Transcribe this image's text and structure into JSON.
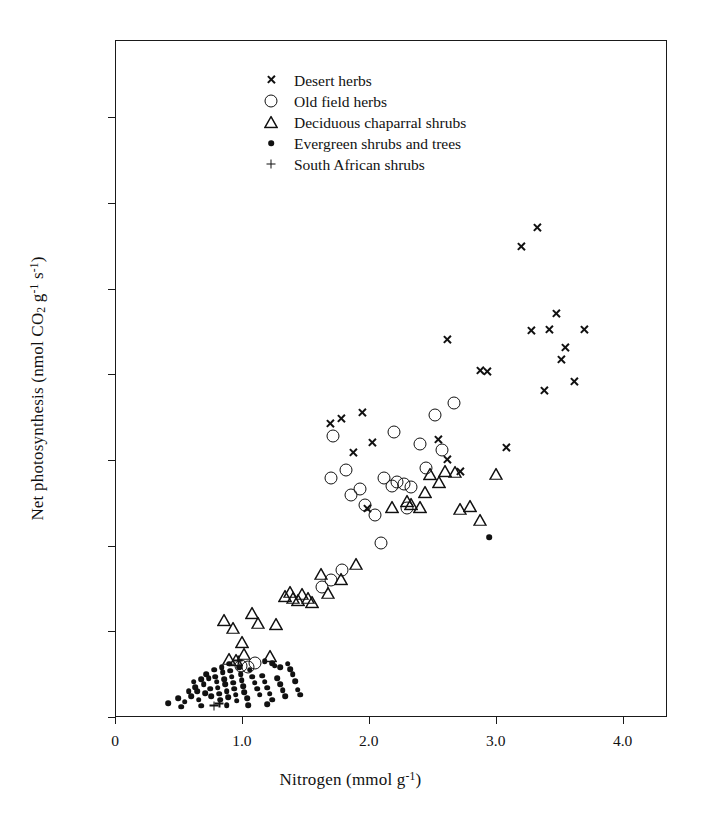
{
  "chart_data": {
    "type": "scatter",
    "title": "",
    "xlabel": "Nitrogen (mmol g-1)",
    "ylabel": "Net photosynthesis (nmol CO2 g-1 s-1)",
    "xlim": [
      0,
      4.35
    ],
    "ylim": [
      0,
      790
    ],
    "xticks": [
      0,
      1.0,
      2.0,
      3.0,
      4.0
    ],
    "xticklabels": [
      "0",
      "1.0",
      "2.0",
      "3.0",
      "4.0"
    ],
    "yticks": [
      0,
      100,
      200,
      300,
      400,
      500,
      600,
      700
    ],
    "yticklabels": [
      "0",
      "100",
      "200",
      "300",
      "400",
      "500",
      "600",
      "700"
    ],
    "grid": false,
    "legend_position": "top-center",
    "series": [
      {
        "name": "Desert herbs",
        "marker": "cross-icon",
        "points": [
          [
            1.7,
            343
          ],
          [
            1.78,
            348
          ],
          [
            1.95,
            355
          ],
          [
            2.03,
            320
          ],
          [
            1.88,
            309
          ],
          [
            1.99,
            243
          ],
          [
            2.55,
            324
          ],
          [
            2.62,
            301
          ],
          [
            2.88,
            404
          ],
          [
            2.93,
            403
          ],
          [
            3.08,
            315
          ],
          [
            3.2,
            549
          ],
          [
            3.33,
            571
          ],
          [
            3.28,
            451
          ],
          [
            3.42,
            452
          ],
          [
            3.38,
            381
          ],
          [
            3.48,
            471
          ],
          [
            3.52,
            417
          ],
          [
            3.55,
            431
          ],
          [
            3.62,
            391
          ],
          [
            3.7,
            452
          ],
          [
            2.72,
            287
          ],
          [
            2.62,
            440
          ]
        ]
      },
      {
        "name": "Old field herbs",
        "marker": "circle-icon",
        "points": [
          [
            1.72,
            328
          ],
          [
            1.7,
            279
          ],
          [
            1.82,
            288
          ],
          [
            1.86,
            259
          ],
          [
            1.93,
            266
          ],
          [
            1.97,
            247
          ],
          [
            2.05,
            236
          ],
          [
            2.1,
            203
          ],
          [
            2.12,
            279
          ],
          [
            2.18,
            270
          ],
          [
            2.22,
            274
          ],
          [
            2.2,
            333
          ],
          [
            2.28,
            272
          ],
          [
            2.33,
            268
          ],
          [
            2.4,
            318
          ],
          [
            2.45,
            291
          ],
          [
            2.52,
            352
          ],
          [
            2.58,
            312
          ],
          [
            2.67,
            366
          ],
          [
            2.3,
            244
          ],
          [
            1.79,
            172
          ],
          [
            1.7,
            160
          ],
          [
            1.63,
            152
          ],
          [
            1.1,
            63
          ],
          [
            0.99,
            60
          ],
          [
            1.05,
            58
          ]
        ]
      },
      {
        "name": "Deciduous chaparral shrubs",
        "marker": "triangle-icon",
        "points": [
          [
            0.86,
            113
          ],
          [
            0.93,
            104
          ],
          [
            1.0,
            87
          ],
          [
            1.02,
            74
          ],
          [
            0.95,
            66
          ],
          [
            0.9,
            68
          ],
          [
            1.08,
            121
          ],
          [
            1.13,
            110
          ],
          [
            1.22,
            71
          ],
          [
            1.27,
            108
          ],
          [
            1.34,
            141
          ],
          [
            1.38,
            146
          ],
          [
            1.4,
            139
          ],
          [
            1.44,
            136
          ],
          [
            1.47,
            144
          ],
          [
            1.52,
            139
          ],
          [
            1.55,
            134
          ],
          [
            1.62,
            167
          ],
          [
            1.68,
            145
          ],
          [
            1.78,
            161
          ],
          [
            1.9,
            179
          ],
          [
            2.18,
            245
          ],
          [
            2.3,
            252
          ],
          [
            2.4,
            245
          ],
          [
            2.48,
            283
          ],
          [
            2.55,
            274
          ],
          [
            2.6,
            287
          ],
          [
            2.68,
            286
          ],
          [
            2.72,
            243
          ],
          [
            2.8,
            246
          ],
          [
            2.88,
            230
          ],
          [
            3.0,
            284
          ],
          [
            2.33,
            248
          ],
          [
            2.44,
            262
          ]
        ]
      },
      {
        "name": "Evergreen shrubs and trees",
        "marker": "dot-icon",
        "points": [
          [
            0.42,
            16
          ],
          [
            0.5,
            22
          ],
          [
            0.55,
            18
          ],
          [
            0.58,
            30
          ],
          [
            0.6,
            24
          ],
          [
            0.62,
            41
          ],
          [
            0.63,
            35
          ],
          [
            0.65,
            30
          ],
          [
            0.66,
            20
          ],
          [
            0.68,
            44
          ],
          [
            0.7,
            38
          ],
          [
            0.71,
            28
          ],
          [
            0.72,
            50
          ],
          [
            0.74,
            45
          ],
          [
            0.75,
            33
          ],
          [
            0.76,
            24
          ],
          [
            0.78,
            55
          ],
          [
            0.79,
            47
          ],
          [
            0.8,
            41
          ],
          [
            0.81,
            34
          ],
          [
            0.82,
            27
          ],
          [
            0.83,
            20
          ],
          [
            0.84,
            58
          ],
          [
            0.85,
            52
          ],
          [
            0.86,
            44
          ],
          [
            0.87,
            38
          ],
          [
            0.88,
            30
          ],
          [
            0.89,
            23
          ],
          [
            0.9,
            62
          ],
          [
            0.91,
            54
          ],
          [
            0.92,
            47
          ],
          [
            0.93,
            40
          ],
          [
            0.94,
            33
          ],
          [
            0.95,
            26
          ],
          [
            0.96,
            19
          ],
          [
            0.98,
            58
          ],
          [
            0.99,
            50
          ],
          [
            1.0,
            43
          ],
          [
            1.01,
            36
          ],
          [
            1.02,
            29
          ],
          [
            1.04,
            22
          ],
          [
            1.06,
            55
          ],
          [
            1.08,
            47
          ],
          [
            1.1,
            40
          ],
          [
            1.12,
            33
          ],
          [
            1.14,
            26
          ],
          [
            1.16,
            48
          ],
          [
            1.18,
            41
          ],
          [
            1.2,
            34
          ],
          [
            1.22,
            27
          ],
          [
            1.24,
            20
          ],
          [
            1.26,
            60
          ],
          [
            1.28,
            45
          ],
          [
            1.3,
            38
          ],
          [
            1.32,
            31
          ],
          [
            1.34,
            24
          ],
          [
            1.36,
            62
          ],
          [
            1.38,
            56
          ],
          [
            1.4,
            50
          ],
          [
            1.42,
            42
          ],
          [
            1.44,
            32
          ],
          [
            1.46,
            26
          ],
          [
            1.18,
            65
          ],
          [
            1.24,
            63
          ],
          [
            1.3,
            58
          ],
          [
            0.52,
            12
          ],
          [
            0.68,
            13
          ],
          [
            0.88,
            14
          ],
          [
            1.05,
            14
          ],
          [
            1.2,
            15
          ],
          [
            2.95,
            210
          ]
        ]
      },
      {
        "name": "South African shrubs",
        "marker": "plus-icon",
        "points": [
          [
            0.82,
            16
          ],
          [
            0.97,
            66
          ],
          [
            0.78,
            13
          ]
        ]
      }
    ]
  },
  "legend": {
    "items": [
      {
        "label": "Desert herbs",
        "marker": "cross-icon"
      },
      {
        "label": "Old field herbs",
        "marker": "circle-icon"
      },
      {
        "label": "Deciduous chaparral shrubs",
        "marker": "triangle-icon"
      },
      {
        "label": "Evergreen shrubs and trees",
        "marker": "dot-icon"
      },
      {
        "label": "South African shrubs",
        "marker": "plus-icon"
      }
    ]
  },
  "axes": {
    "x_title_parts": {
      "name": "Nitrogen (mmol g",
      "exp": "-1",
      "tail": ")"
    },
    "y_title_parts": {
      "name": "Net photosynthesis (nmol CO",
      "sub": "2",
      "mid": " g",
      "exp1": "-1",
      "mid2": " s",
      "exp2": "-1",
      "tail": ")"
    }
  },
  "colors": {
    "ink": "#111111",
    "background": "#ffffff"
  }
}
